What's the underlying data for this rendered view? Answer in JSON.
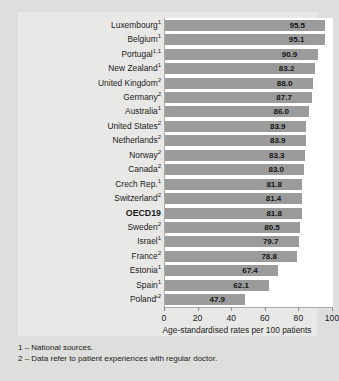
{
  "chart_data": {
    "type": "bar",
    "orientation": "horizontal",
    "title": "",
    "xlabel": "Age-standardised rates per 100 patients",
    "ylabel": "",
    "xlim": [
      0,
      100
    ],
    "xticks": [
      0,
      20,
      40,
      60,
      80,
      100
    ],
    "grid": false,
    "legend": null,
    "bar_color": "#9b9b9b",
    "categories": [
      "Luxembourg",
      "Belgium",
      "Portugal",
      "New Zealand",
      "United Kingdom",
      "Germany",
      "Australia",
      "United States",
      "Netherlands",
      "Norway",
      "Canada",
      "Crech Rep.",
      "Switzerland",
      "OECD19",
      "Sweden",
      "Israel",
      "France",
      "Estonia",
      "Spain",
      "Poland'"
    ],
    "category_footnote_marks": [
      "1",
      "1",
      "1,1",
      "1",
      "2",
      "2",
      "1",
      "2",
      "2",
      "2",
      "2",
      "1",
      "2",
      "",
      "2",
      "1",
      "2",
      "1",
      "1",
      "2"
    ],
    "value_labels": [
      "95.5",
      "95.1",
      "90.9",
      "83.2",
      "88.0",
      "87.7",
      "86.0",
      "83.9",
      "83.9",
      "83.3",
      "83.0",
      "81.8",
      "81.4",
      "81.8",
      "80.5",
      "79.7",
      "78.8",
      "67.4",
      "62.1",
      "47.9"
    ],
    "values": [
      95.5,
      95.1,
      90.9,
      89.2,
      88.0,
      87.7,
      86.0,
      83.9,
      83.9,
      83.3,
      83.0,
      81.8,
      81.4,
      81.8,
      80.5,
      79.7,
      78.8,
      67.4,
      62.1,
      47.9
    ],
    "highlighted_category": "OECD19"
  },
  "footnotes": [
    "1 – National sources.",
    "2 – Data refer to patient experiences with regular doctor."
  ]
}
